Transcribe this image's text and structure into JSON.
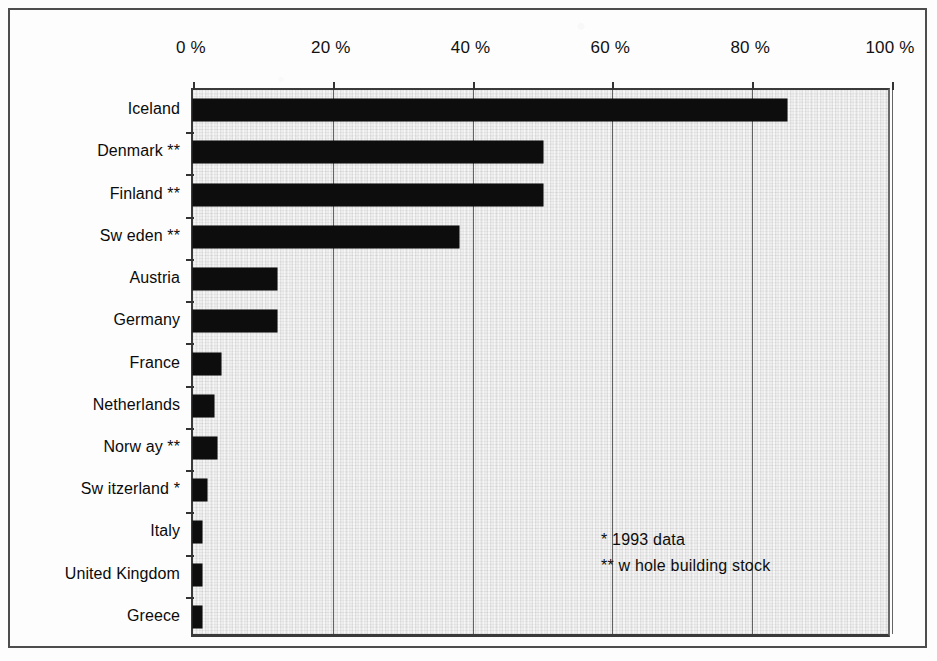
{
  "figure": {
    "background_color": "#fdfdfd",
    "frame_color": "#4d4d4d",
    "bar_color": "#0d0d0d",
    "plot_background_color": "#eeeeee",
    "gridline_color": "#4a4a4a"
  },
  "annotations": [
    {
      "id": "note-single-star",
      "text": "* 1993 data"
    },
    {
      "id": "note-double-star",
      "text": "** w hole building stock"
    }
  ],
  "chart_data": {
    "type": "bar",
    "orientation": "horizontal",
    "title": "",
    "subtitle": "",
    "xlabel": "",
    "ylabel": "",
    "xlim": [
      0,
      100
    ],
    "grid": true,
    "legend": false,
    "legend_position": "none",
    "xtick_labels": [
      "0 %",
      "20 %",
      "40 %",
      "60 %",
      "80 %",
      "100 %"
    ],
    "xticks": [
      0,
      20,
      40,
      60,
      80,
      100
    ],
    "categories": [
      "Iceland",
      "Denmark **",
      "Finland **",
      "Sw eden **",
      "Austria",
      "Germany",
      "France",
      "Netherlands",
      "Norw ay **",
      "Sw itzerland *",
      "Italy",
      "United Kingdom",
      "Greece"
    ],
    "values": [
      85,
      50,
      50,
      38,
      12,
      12,
      4,
      3,
      3.5,
      2,
      1.3,
      1.3,
      1.3
    ],
    "annotations": [
      "* 1993 data",
      "** w hole building stock"
    ]
  }
}
